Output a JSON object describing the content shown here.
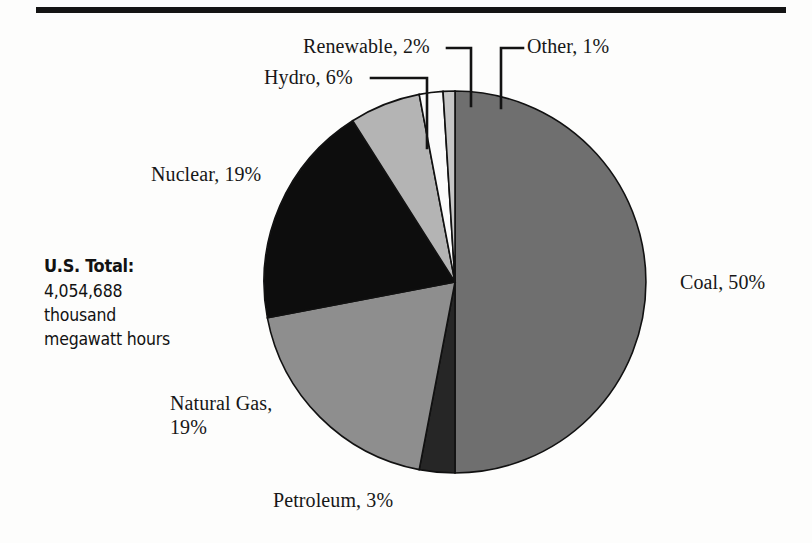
{
  "page": {
    "rule_color": "#141414"
  },
  "total_panel": {
    "heading": "U.S. Total:",
    "value": "4,054,688",
    "unit_line1": "thousand",
    "unit_line2": "megawatt hours"
  },
  "labels": {
    "coal": "Coal, 50%",
    "petroleum": "Petroleum, 3%",
    "natural_gas_line1": "Natural Gas,",
    "natural_gas_line2": "19%",
    "nuclear": "Nuclear, 19%",
    "hydro": "Hydro, 6%",
    "renewable": "Renewable, 2%",
    "other": "Other, 1%"
  },
  "chart_data": {
    "type": "pie",
    "subtitle": "U.S. Total: 4,054,688 thousand megawatt hours",
    "total_value": 4054688,
    "total_units": "thousand megawatt hours",
    "value_unit": "percent",
    "start_angle_deg": 0,
    "direction": "clockwise",
    "legend": "none",
    "labels_position": "outside-with-leader-lines",
    "categories": [
      "Coal",
      "Petroleum",
      "Natural Gas",
      "Nuclear",
      "Hydro",
      "Renewable",
      "Other"
    ],
    "values": [
      50,
      3,
      19,
      19,
      6,
      2,
      1
    ],
    "slices": [
      {
        "label": "Coal",
        "value": 50,
        "display": "Coal, 50%",
        "color": "#6f6f6f",
        "start_deg": 0,
        "end_deg": 180
      },
      {
        "label": "Petroleum",
        "value": 3,
        "display": "Petroleum, 3%",
        "color": "#262626",
        "start_deg": 180,
        "end_deg": 190.8
      },
      {
        "label": "Natural Gas",
        "value": 19,
        "display": "Natural Gas, 19%",
        "color": "#8e8e8e",
        "start_deg": 190.8,
        "end_deg": 259.2
      },
      {
        "label": "Nuclear",
        "value": 19,
        "display": "Nuclear, 19%",
        "color": "#0d0d0d",
        "start_deg": 259.2,
        "end_deg": 327.6
      },
      {
        "label": "Hydro",
        "value": 6,
        "display": "Hydro, 6%",
        "color": "#b4b4b4",
        "start_deg": 327.6,
        "end_deg": 349.2
      },
      {
        "label": "Renewable",
        "value": 2,
        "display": "Renewable, 2%",
        "color": "#fbfbfb",
        "start_deg": 349.2,
        "end_deg": 356.4
      },
      {
        "label": "Other",
        "value": 1,
        "display": "Other, 1%",
        "color": "#c6c6c6",
        "start_deg": 356.4,
        "end_deg": 360
      }
    ],
    "geometry": {
      "cx": 455,
      "cy": 282,
      "r": 191
    }
  }
}
